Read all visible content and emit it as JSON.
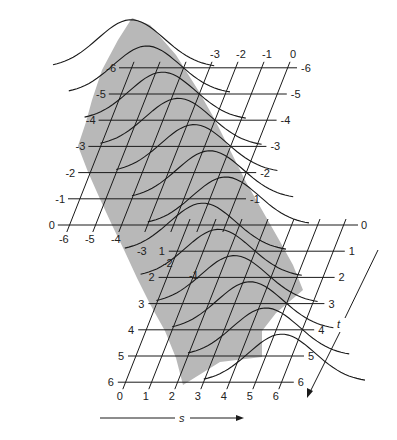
{
  "figure": {
    "colors": {
      "surface_fill": "#b8b8b8",
      "line": "#1a1a1a",
      "background": "#ffffff"
    },
    "upper_grid": {
      "t_labels_left": [
        "-6",
        "-5",
        "-4",
        "-3",
        "-2",
        "-1",
        "0"
      ],
      "t_labels_right": [
        "-6",
        "-5",
        "-4",
        "-3",
        "-2",
        "-1"
      ],
      "s_labels_top": [
        "-3",
        "-2",
        "-1",
        "0"
      ],
      "s_labels_bottom": [
        "-6",
        "-5",
        "-4",
        "-3",
        "-2",
        "-1"
      ]
    },
    "lower_grid": {
      "t_labels_left": [
        "1",
        "2",
        "3",
        "4",
        "5",
        "6"
      ],
      "t_labels_right": [
        "0",
        "1",
        "2",
        "3",
        "4",
        "5",
        "6"
      ],
      "s_labels_bottom": [
        "0",
        "1",
        "2",
        "3",
        "4",
        "5",
        "6"
      ]
    },
    "axes": {
      "s_label": "s",
      "t_label": "t"
    }
  }
}
